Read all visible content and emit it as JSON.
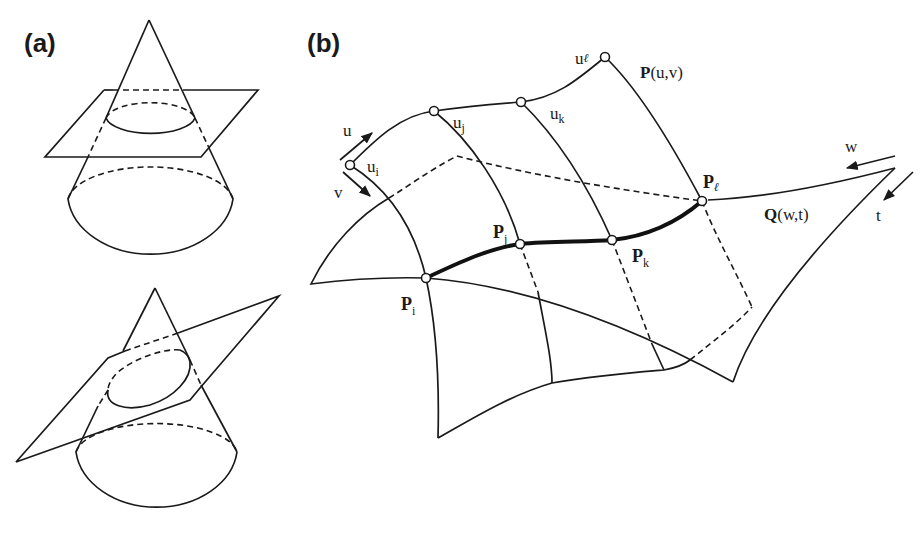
{
  "panels": {
    "a": {
      "label": "(a)",
      "description": "Cone intersected by a horizontal plane (circle) and by an inclined plane (ellipse)"
    },
    "b": {
      "label": "(b)",
      "surface_p": {
        "name": "P",
        "params": "(u,v)"
      },
      "surface_q": {
        "name": "Q",
        "params": "(w,t)"
      },
      "param_arrows": {
        "u": "u",
        "v": "v",
        "w": "w",
        "t": "t"
      },
      "u_points": [
        {
          "base": "u",
          "sub": "i"
        },
        {
          "base": "u",
          "sub": "j"
        },
        {
          "base": "u",
          "sub": "k"
        },
        {
          "base": "u",
          "sub": "ℓ"
        }
      ],
      "intersection_points": [
        {
          "base": "P",
          "sub": "i"
        },
        {
          "base": "P",
          "sub": "j"
        },
        {
          "base": "P",
          "sub": "k"
        },
        {
          "base": "P",
          "sub": "ℓ"
        }
      ]
    }
  },
  "colors": {
    "line": "#1a1a1a",
    "background": "#ffffff"
  }
}
